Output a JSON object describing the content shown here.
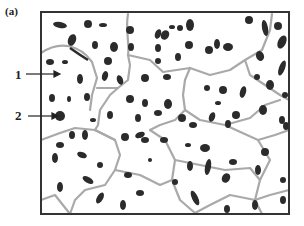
{
  "figure": {
    "panel_label": "(a)",
    "annotations": [
      {
        "label": "1",
        "target": "grain (matrix)",
        "arrow_from": [
          26,
          74
        ],
        "arrow_to": [
          60,
          74
        ]
      },
      {
        "label": "2",
        "target": "particle",
        "arrow_from": [
          28,
          116
        ],
        "arrow_to": [
          58,
          116
        ]
      }
    ],
    "frame": {
      "x": 41,
      "y": 12,
      "width": 248,
      "height": 202,
      "stroke": "#333333"
    },
    "colors": {
      "grain_boundary": "#a9a9a9",
      "particle": "#2b2b2b",
      "background": "#ffffff"
    }
  }
}
